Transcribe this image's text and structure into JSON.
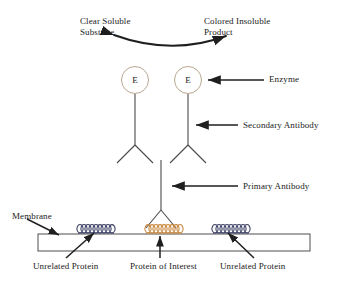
{
  "diagram": {
    "type": "labeled-biology-schematic",
    "background_color": "#ffffff",
    "line_color": "#333333",
    "text_color": "#1a1a1a",
    "accent_color": "#c8873c",
    "protein_colors": {
      "unrelated_protein": "#3a3f63",
      "protein_of_interest": "#c8873c"
    },
    "labels": {
      "clear_soluble_substrate_line1": "Clear Soluble",
      "clear_soluble_substrate_line2": "Substrate",
      "colored_insoluble_product_line1": "Colored Insoluble",
      "colored_insoluble_product_line2": "Product",
      "enzyme": "Enzyme",
      "secondary_antibody": "Secondary Antibody",
      "primary_antibody": "Primary Antibody",
      "membrane": "Membrane",
      "unrelated_protein_left": "Unrelated Protein",
      "protein_of_interest": "Protein of Interest",
      "unrelated_protein_right": "Unrelated Protein"
    },
    "enzyme_markers": {
      "left_letter": "E",
      "right_letter": "E"
    },
    "components": [
      {
        "name": "curved-reaction-arrow",
        "from": "Clear Soluble Substrate",
        "to": "Colored Insoluble Product"
      },
      {
        "name": "enzyme-circle-left",
        "letter": "E"
      },
      {
        "name": "enzyme-circle-right",
        "letter": "E"
      },
      {
        "name": "secondary-antibody-left",
        "shape": "inverted-Y"
      },
      {
        "name": "secondary-antibody-right",
        "shape": "inverted-Y"
      },
      {
        "name": "primary-antibody",
        "shape": "inverted-Y"
      },
      {
        "name": "membrane-strip",
        "shape": "rectangle"
      },
      {
        "name": "unrelated-protein-band-left",
        "shape": "coil"
      },
      {
        "name": "protein-of-interest-band",
        "shape": "coil"
      },
      {
        "name": "unrelated-protein-band-right",
        "shape": "coil"
      }
    ]
  }
}
